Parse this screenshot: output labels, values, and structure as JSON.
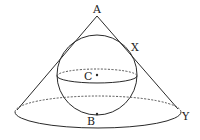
{
  "diagram": {
    "type": "geometry-figure",
    "labels": {
      "apex": "A",
      "tangent_point": "X",
      "center": "C",
      "bottom_point": "B",
      "base_edge_point": "Y"
    },
    "colors": {
      "stroke": "#2a2a2a",
      "background": "#ffffff"
    }
  }
}
